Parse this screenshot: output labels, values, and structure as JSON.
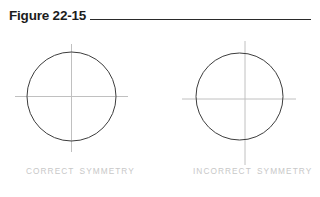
{
  "figure": {
    "title": "Figure 22-15",
    "rule": {
      "visible": true,
      "color": "#2a2a2a"
    }
  },
  "panels": [
    {
      "id": "correct-symmetry",
      "caption": "CORRECT SYMMETRY",
      "circle": {
        "cx": 71.5,
        "cy": 96.5,
        "r": 44.5,
        "stroke": "#3d3d3d"
      },
      "crosshair": {
        "cx": 71.5,
        "cy": 96.5,
        "vertical": {
          "x": 71.5,
          "y1": 44,
          "y2": 152
        },
        "horizontal": {
          "y": 96.5,
          "x1": 15,
          "x2": 128
        },
        "stroke": "#c0c0c0",
        "aligned": true
      }
    },
    {
      "id": "incorrect-symmetry",
      "caption": "INCORRECT SYMMETRY",
      "circle": {
        "cx": 239.5,
        "cy": 96.5,
        "r": 43.5,
        "stroke": "#3d3d3d"
      },
      "crosshair": {
        "cx": 245,
        "cy": 99,
        "vertical": {
          "x": 245,
          "y1": 41,
          "y2": 165
        },
        "horizontal": {
          "y": 99,
          "x1": 182,
          "x2": 296
        },
        "stroke": "#c0c0c0",
        "aligned": false
      }
    }
  ],
  "colors": {
    "background": "#ffffff",
    "title_text": "#1c1c1c",
    "rule": "#2a2a2a",
    "circle_stroke": "#3d3d3d",
    "crosshair_stroke": "#c0c0c0",
    "caption_text": "#c8c8c8"
  }
}
